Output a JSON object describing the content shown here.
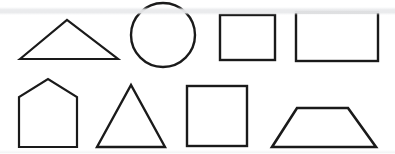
{
  "sheet": {
    "title": "Geometric Shapes",
    "background_color": "#ffffff",
    "stroke_color": "#1a1a1a",
    "stroke_width": 2.2,
    "width": 395,
    "height": 154,
    "artifact_band_color": "#e9eaec"
  },
  "chart_data": {
    "type": "diagram",
    "shape_count": 8,
    "row_count": 2,
    "shapes": [
      {
        "name": "triangle-obtuse",
        "label": "Triangle",
        "row": 1,
        "column": 1,
        "geometry": "polygon",
        "points": "20,59 67,20 118,59",
        "bbox": [
          20,
          20,
          98,
          39
        ]
      },
      {
        "name": "circle",
        "label": "Circle",
        "row": 1,
        "column": 2,
        "geometry": "ellipse",
        "cx": 163,
        "cy": 35,
        "rx": 32,
        "ry": 32,
        "bbox": [
          131,
          3,
          64,
          64
        ]
      },
      {
        "name": "rectangle-small",
        "label": "Rectangle",
        "row": 1,
        "column": 3,
        "geometry": "rect",
        "x": 220,
        "y": 15,
        "width": 55,
        "height": 45,
        "bbox": [
          220,
          15,
          55,
          45
        ]
      },
      {
        "name": "rectangle-wide",
        "label": "Rectangle",
        "row": 1,
        "column": 4,
        "geometry": "rect",
        "x": 296,
        "y": 12,
        "width": 82,
        "height": 49,
        "bbox": [
          296,
          12,
          82,
          49
        ]
      },
      {
        "name": "pentagon-house",
        "label": "Pentagon",
        "row": 2,
        "column": 1,
        "geometry": "polygon",
        "points": "19,147 19,97 48,79 77,97 77,147",
        "bbox": [
          19,
          79,
          58,
          68
        ]
      },
      {
        "name": "triangle-equilateral",
        "label": "Triangle",
        "row": 2,
        "column": 2,
        "geometry": "polygon",
        "points": "97,147 131,85 165,147",
        "bbox": [
          97,
          85,
          68,
          62
        ]
      },
      {
        "name": "square",
        "label": "Square",
        "row": 2,
        "column": 3,
        "geometry": "rect",
        "x": 187,
        "y": 86,
        "width": 60,
        "height": 60,
        "bbox": [
          187,
          86,
          60,
          60
        ]
      },
      {
        "name": "trapezoid",
        "label": "Trapezoid",
        "row": 2,
        "column": 4,
        "geometry": "polygon",
        "points": "272,147 297,108 348,108 376,147",
        "bbox": [
          272,
          108,
          104,
          39
        ]
      }
    ]
  }
}
